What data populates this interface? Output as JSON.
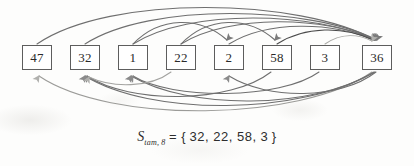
{
  "figure": {
    "background_color": "#fdfdfc",
    "line_color": "#6f6f6f",
    "box_border_color": "#5d5d5d",
    "text_color": "#2a2a2a"
  },
  "nodes": [
    {
      "label": "47",
      "x": 22,
      "y": 45
    },
    {
      "label": "32",
      "x": 70,
      "y": 45
    },
    {
      "label": "1",
      "x": 118,
      "y": 45
    },
    {
      "label": "22",
      "x": 166,
      "y": 45
    },
    {
      "label": "2",
      "x": 214,
      "y": 45
    },
    {
      "label": "58",
      "x": 262,
      "y": 45
    },
    {
      "label": "3",
      "x": 310,
      "y": 45
    },
    {
      "label": "36",
      "x": 362,
      "y": 45
    }
  ],
  "edges_above": [
    {
      "from": "47",
      "to": "36",
      "direction": "right"
    },
    {
      "from": "32",
      "to": "36",
      "direction": "right"
    },
    {
      "from": "1",
      "to": "36",
      "direction": "right"
    },
    {
      "from": "22",
      "to": "36",
      "direction": "right"
    },
    {
      "from": "2",
      "to": "36",
      "direction": "right"
    },
    {
      "from": "58",
      "to": "36",
      "direction": "right"
    },
    {
      "from": "3",
      "to": "36",
      "direction": "right"
    },
    {
      "from": "1",
      "to": "2",
      "direction": "right"
    },
    {
      "from": "22",
      "to": "58",
      "direction": "right"
    }
  ],
  "edges_below": [
    {
      "from": "36",
      "to": "47",
      "direction": "left"
    },
    {
      "from": "36",
      "to": "32",
      "direction": "left"
    },
    {
      "from": "36",
      "to": "1",
      "direction": "left"
    },
    {
      "from": "36",
      "to": "2",
      "direction": "left"
    },
    {
      "from": "58",
      "to": "32",
      "direction": "left"
    },
    {
      "from": "3",
      "to": "1",
      "direction": "left"
    },
    {
      "from": "22",
      "to": "32",
      "direction": "left"
    }
  ],
  "caption": {
    "symbol": "S",
    "subscript": "tam, 8",
    "equals": "= {",
    "values": "32,   22,   58,   3",
    "close": "}",
    "full_text": "Stam,8 = { 32, 22, 58, 3 }"
  }
}
